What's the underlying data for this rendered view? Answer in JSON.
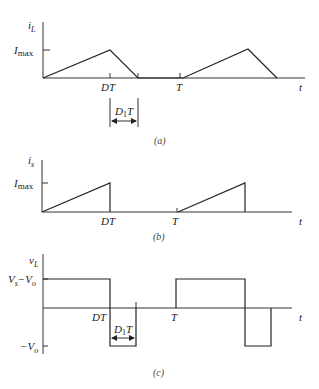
{
  "panels": [
    {
      "id": "a",
      "caption": "(a)",
      "y_label": "i",
      "y_label_sub": "L",
      "level_label": "I",
      "level_label_sub": "max",
      "x_ticks": [
        "DT",
        "T"
      ],
      "x_axis_label": "t",
      "interval_label": "D",
      "interval_label_sub": "1",
      "interval_label_suffix": "T"
    },
    {
      "id": "b",
      "caption": "(b)",
      "y_label": "i",
      "y_label_sub": "s",
      "level_label": "I",
      "level_label_sub": "max",
      "x_ticks": [
        "DT",
        "T"
      ],
      "x_axis_label": "t"
    },
    {
      "id": "c",
      "caption": "(c)",
      "y_label": "v",
      "y_label_sub": "L",
      "high_label": "V",
      "high_label_sub": "s",
      "high_label_mid": "−V",
      "high_label_sub2": "o",
      "low_label": "−V",
      "low_label_sub": "o",
      "x_ticks": [
        "DT",
        "T"
      ],
      "x_axis_label": "t",
      "interval_label": "D",
      "interval_label_sub": "1",
      "interval_label_suffix": "T"
    }
  ]
}
